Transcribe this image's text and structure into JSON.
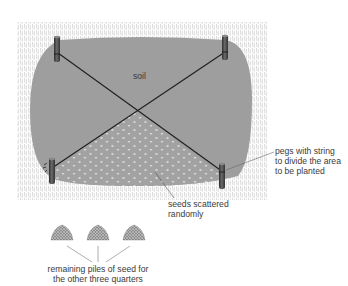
{
  "diagram": {
    "labels": {
      "soil": "soil",
      "pegs": [
        "pegs with string",
        "to divide the area",
        "to be planted"
      ],
      "seeds": [
        "seeds scattered",
        "randomly"
      ],
      "piles": [
        "remaining piles of seed for",
        "the other three quarters"
      ]
    },
    "colors": {
      "soil": "#9e9e9e",
      "seeded_soil": "#a4a4a4",
      "grass": "#b8b8b8",
      "string": "#1e1e1e",
      "peg": "#4a4a4a",
      "leader": "#555555"
    },
    "elements": {
      "pegs": [
        "top-left",
        "top-right",
        "bottom-left",
        "bottom-right"
      ],
      "seed_piles": 3
    }
  }
}
